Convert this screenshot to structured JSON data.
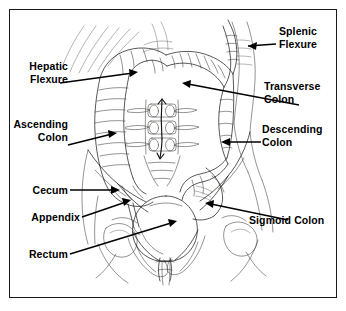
{
  "figure": {
    "background_color": "#ffffff",
    "frame_color": "#1a1a1a",
    "ink_color": "#20201f",
    "label_color": "#000000"
  },
  "labels": {
    "splenic_flexure": "Splenic\nFlexure",
    "hepatic_flexure": "Hepatic\nFlexure",
    "transverse_colon": "Transverse\nColon",
    "ascending_colon": "Ascending\nColon",
    "descending_colon": "Descending\nColon",
    "cecum": "Cecum",
    "appendix": "Appendix",
    "rectum": "Rectum",
    "sigmoid_colon": "Sigmoid Colon"
  },
  "callouts": [
    {
      "key": "splenic_flexure",
      "text": "Splenic\nFlexure",
      "align": "left",
      "label_x": 279,
      "label_y": 25,
      "arrow_from_x": 276,
      "arrow_from_y": 44,
      "arrow_to_x": 243,
      "arrow_to_y": 46,
      "arrow_direction": "left"
    },
    {
      "key": "hepatic_flexure",
      "text": "Hepatic\nFlexure",
      "align": "right",
      "label_x": 18,
      "label_y": 65,
      "arrow_from_x": 81,
      "arrow_from_y": 87,
      "arrow_to_x": 138,
      "arrow_to_y": 74,
      "arrow_direction": "right"
    },
    {
      "key": "transverse_colon",
      "text": "Transverse\nColon",
      "align": "left",
      "label_x": 266,
      "label_y": 80,
      "arrow_from_x": 299,
      "arrow_from_y": 105,
      "arrow_to_x": 182,
      "arrow_to_y": 84,
      "arrow_direction": "left"
    },
    {
      "key": "ascending_colon",
      "text": "Ascending\nColon",
      "align": "right",
      "label_x": 14,
      "label_y": 122,
      "arrow_from_x": 72,
      "arrow_from_y": 143,
      "arrow_to_x": 117,
      "arrow_to_y": 134,
      "arrow_direction": "right"
    },
    {
      "key": "descending_colon",
      "text": "Descending\nColon",
      "align": "left",
      "label_x": 262,
      "label_y": 125,
      "arrow_from_x": 261,
      "arrow_from_y": 142,
      "arrow_to_x": 222,
      "arrow_to_y": 142,
      "arrow_direction": "left"
    },
    {
      "key": "cecum",
      "text": "Cecum",
      "align": "right",
      "label_x": 18,
      "label_y": 186,
      "arrow_from_x": 73,
      "arrow_from_y": 190,
      "arrow_to_x": 119,
      "arrow_to_y": 190,
      "arrow_direction": "right"
    },
    {
      "key": "appendix",
      "text": "Appendix",
      "align": "right",
      "label_x": 14,
      "label_y": 214,
      "arrow_from_x": 85,
      "arrow_from_y": 216,
      "arrow_to_x": 130,
      "arrow_to_y": 200,
      "arrow_direction": "right"
    },
    {
      "key": "rectum",
      "text": "Rectum",
      "align": "right",
      "label_x": 18,
      "label_y": 252,
      "arrow_from_x": 72,
      "arrow_from_y": 253,
      "arrow_to_x": 176,
      "arrow_to_y": 221,
      "arrow_direction": "right"
    },
    {
      "key": "sigmoid_colon",
      "text": "Sigmoid Colon",
      "align": "left",
      "label_x": 249,
      "label_y": 214,
      "arrow_from_x": 288,
      "arrow_from_y": 220,
      "arrow_to_x": 205,
      "arrow_to_y": 203,
      "arrow_direction": "left"
    }
  ],
  "anatomy_parts": [
    "ribs",
    "ascending-colon",
    "transverse-colon",
    "descending-colon",
    "sigmoid-colon",
    "cecum",
    "appendix",
    "rectum",
    "spine-vertebrae",
    "pelvis",
    "bladder"
  ]
}
